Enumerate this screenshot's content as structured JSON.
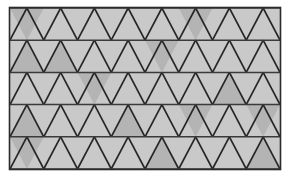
{
  "figure": {
    "type": "geometric-tiling",
    "canvas": {
      "width": 290,
      "height": 181,
      "background": "#ffffff"
    },
    "frame": {
      "x": 10,
      "y": 8,
      "width": 270,
      "height": 161,
      "stroke": "#2b2b2b",
      "stroke_width": 1.6,
      "fill": "#c9c9c9"
    },
    "grid": {
      "rows": 5,
      "columns": 8,
      "row_height": 32.2,
      "half_cell_width": 16.875,
      "cell_width": 33.75,
      "line_color": "#262626",
      "line_width": 1.7,
      "row_line_color": "#3a3a3a",
      "row_line_width": 1.5
    },
    "colors": {
      "base_fill": "#c9c9c9",
      "shaded_fill": "#b4b4b4",
      "line": "#262626",
      "frame_stroke": "#2b2b2b",
      "background": "#ffffff"
    },
    "shaded_triangles": [
      {
        "row": 0,
        "col": 0,
        "dir": "down"
      },
      {
        "row": 0,
        "col": 5,
        "dir": "down"
      },
      {
        "row": 1,
        "col": 0,
        "dir": "up"
      },
      {
        "row": 1,
        "col": 1,
        "dir": "up"
      },
      {
        "row": 1,
        "col": 4,
        "dir": "down"
      },
      {
        "row": 2,
        "col": 2,
        "dir": "down"
      },
      {
        "row": 2,
        "col": 6,
        "dir": "up"
      },
      {
        "row": 3,
        "col": 0,
        "dir": "up"
      },
      {
        "row": 3,
        "col": 3,
        "dir": "up"
      },
      {
        "row": 3,
        "col": 5,
        "dir": "down"
      },
      {
        "row": 3,
        "col": 7,
        "dir": "down"
      },
      {
        "row": 4,
        "col": 0,
        "dir": "down"
      },
      {
        "row": 4,
        "col": 4,
        "dir": "up"
      },
      {
        "row": 4,
        "col": 7,
        "dir": "up"
      }
    ]
  }
}
